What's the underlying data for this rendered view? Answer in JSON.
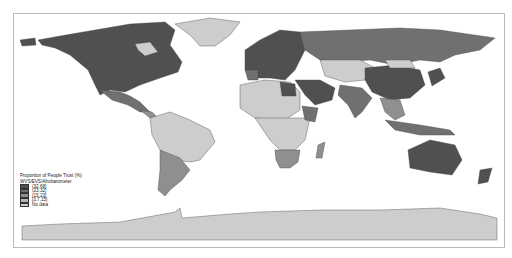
{
  "map": {
    "type": "choropleth",
    "projection": "equirectangular world",
    "colors": {
      "c1": "#505050",
      "c2": "#707070",
      "c3": "#8f8f8f",
      "c4": "#b4b4b4",
      "nodata": "#cdcdcd"
    }
  },
  "legend": {
    "title": "Proportion of People Trust (%)",
    "subtitle": "WVS/EVS/Afrobarometer",
    "items": [
      {
        "label": "(32,68]",
        "color": "#505050"
      },
      {
        "label": "(23,32]",
        "color": "#707070"
      },
      {
        "label": "(15,23]",
        "color": "#8f8f8f"
      },
      {
        "label": "[3.7,15]",
        "color": "#b4b4b4"
      },
      {
        "label": "No data",
        "color": "#cdcdcd"
      }
    ]
  }
}
